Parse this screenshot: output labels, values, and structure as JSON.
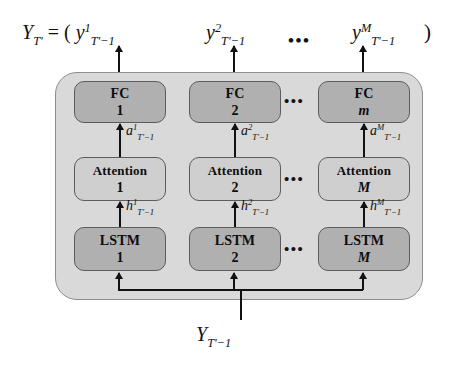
{
  "figure": {
    "type": "neural-network-architecture-diagram",
    "output_row": {
      "lhs": "Y",
      "lhs_sub": "T'",
      "equals": " = ( ",
      "terms": [
        {
          "base": "y",
          "sup": "1",
          "sub": "T'−1"
        },
        {
          "base": "y",
          "sup": "2",
          "sub": "T'−1"
        },
        {
          "base": "y",
          "sup": "M",
          "sub": "T'−1"
        }
      ],
      "ellipsis": "•••",
      "rparen": " )"
    },
    "columns": [
      {
        "fc": {
          "title": "FC",
          "index": "1",
          "italic_index": false
        },
        "attn": {
          "title": "Attention",
          "index": "1",
          "italic_index": false
        },
        "lstm": {
          "title": "LSTM",
          "index": "1",
          "italic_index": false
        },
        "a_label": {
          "base": "a",
          "sup": "1",
          "sub": "T'−1"
        },
        "h_label": {
          "base": "h",
          "sup": "1",
          "sub": "T'−1"
        }
      },
      {
        "fc": {
          "title": "FC",
          "index": "2",
          "italic_index": false
        },
        "attn": {
          "title": "Attention",
          "index": "2",
          "italic_index": false
        },
        "lstm": {
          "title": "LSTM",
          "index": "2",
          "italic_index": false
        },
        "a_label": {
          "base": "a",
          "sup": "2",
          "sub": "T'−1"
        },
        "h_label": {
          "base": "h",
          "sup": "2",
          "sub": "T'−1"
        }
      },
      {
        "fc": {
          "title": "FC",
          "index": "m",
          "italic_index": true
        },
        "attn": {
          "title": "Attention",
          "index": "M",
          "italic_index": true
        },
        "lstm": {
          "title": "LSTM",
          "index": "M",
          "italic_index": true
        },
        "a_label": {
          "base": "a",
          "sup": "M",
          "sub": "T'−1"
        },
        "h_label": {
          "base": "h",
          "sup": "M",
          "sub": "T'−1"
        }
      }
    ],
    "row_ellipsis": "•••",
    "input_label": {
      "base": "Y",
      "sub": "T'−1"
    },
    "colors": {
      "background": "#ffffff",
      "container_fill": "#d9d9d9",
      "container_stroke": "#8e8e8e",
      "fc_fill": "#b0b0b0",
      "attention_fill": "#cfcfcf",
      "lstm_fill": "#b0b0b0",
      "node_stroke": "#5c5c5c",
      "arrow": "#111111",
      "text": "#111111"
    }
  }
}
